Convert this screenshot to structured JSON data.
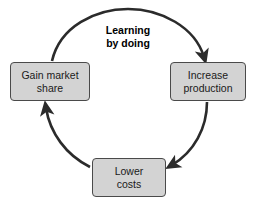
{
  "diagram": {
    "title": "Learning\nby doing",
    "type": "cycle-diagram",
    "background_color": "#ffffff",
    "node_fill_color": "#d3d3d3",
    "node_border_color": "#4a4a4a",
    "arrow_color": "#2b2b2b",
    "nodes": [
      {
        "id": "gain-market-share",
        "label": "Gain market\nshare",
        "position": "left"
      },
      {
        "id": "increase-production",
        "label": "Increase\nproduction",
        "position": "right"
      },
      {
        "id": "lower-costs",
        "label": "Lower\ncosts",
        "position": "bottom"
      }
    ],
    "arrows": [
      {
        "id": "arrow-gain-to-increase",
        "from": "gain-market-share",
        "to": "increase-production",
        "direction": "clockwise-top"
      },
      {
        "id": "arrow-increase-to-lower",
        "from": "increase-production",
        "to": "lower-costs",
        "direction": "clockwise-right"
      },
      {
        "id": "arrow-lower-to-gain",
        "from": "lower-costs",
        "to": "gain-market-share",
        "direction": "clockwise-left"
      }
    ]
  }
}
